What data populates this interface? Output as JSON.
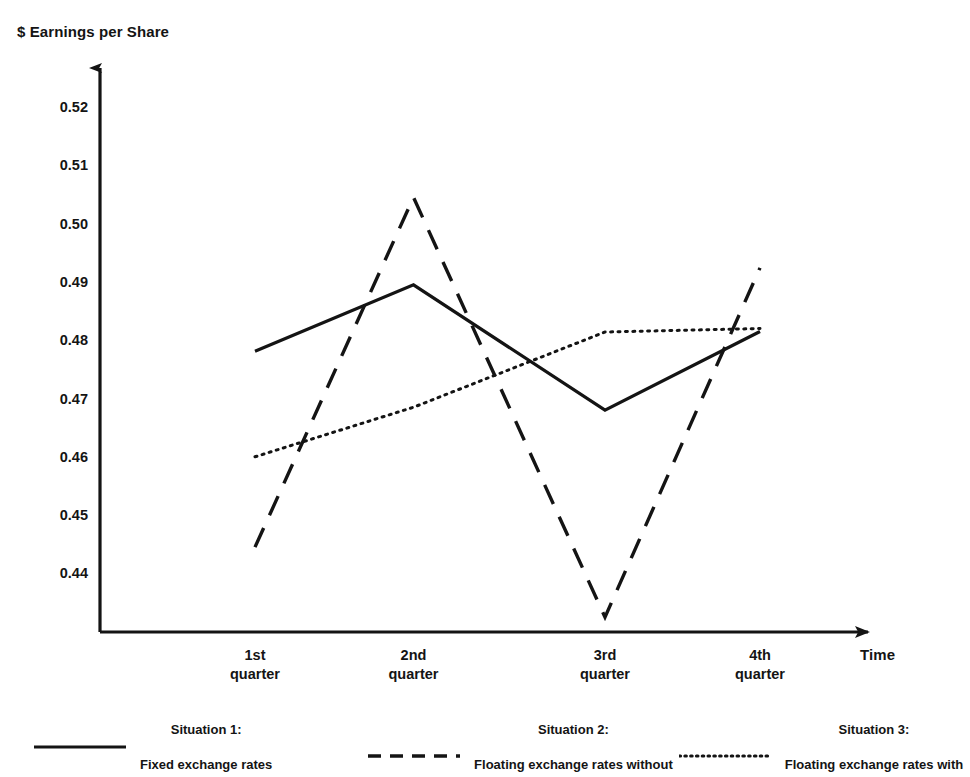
{
  "chart_data": {
    "type": "line",
    "title": "",
    "xlabel": "Time",
    "ylabel": "$ Earnings per Share",
    "categories": [
      "1st\nquarter",
      "2nd\nquarter",
      "3rd\nquarter",
      "4th\nquarter"
    ],
    "category_labels_flat": [
      "1st quarter",
      "2nd quarter",
      "3rd quarter",
      "4th quarter"
    ],
    "ytick_labels": [
      "0.52",
      "0.51",
      "0.50",
      "0.49",
      "0.48",
      "0.47",
      "0.46",
      "0.45",
      "0.44"
    ],
    "ytick_values": [
      0.52,
      0.51,
      0.5,
      0.49,
      0.48,
      0.47,
      0.46,
      0.45,
      0.44
    ],
    "ylim": [
      0.4315,
      0.5255
    ],
    "grid": false,
    "legend_position": "bottom",
    "series": [
      {
        "name": "Situation 1:\nFixed exchange rates",
        "legend_title": "Situation 1:",
        "legend_desc": "Fixed exchange rates",
        "style": "solid",
        "color": "#141414",
        "values": [
          0.4781,
          0.4895,
          0.468,
          0.4815
        ]
      },
      {
        "name": "Situation 2:\nFloating exchange rates without exchange risk management",
        "legend_title": "Situation 2:",
        "legend_desc": "Floating exchange rates without\nexchange risk management",
        "style": "dashed",
        "color": "#141414",
        "values": [
          0.4445,
          0.5045,
          0.4325,
          0.4924
        ]
      },
      {
        "name": "Situation 3:\nFloating exchange rates with exchange risk management",
        "legend_title": "Situation 3:",
        "legend_desc": "Floating exchange rates with\nexchange risk management",
        "style": "dotted",
        "color": "#141414",
        "values": [
          0.46,
          0.4685,
          0.4814,
          0.482
        ]
      }
    ]
  },
  "axes": {
    "y_title": "$ Earnings per Share",
    "x_title": "Time"
  },
  "colors": {
    "ink": "#141414",
    "background": "#ffffff"
  }
}
